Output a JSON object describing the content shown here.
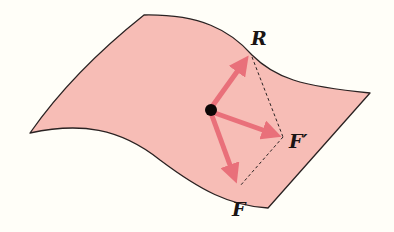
{
  "diagram": {
    "surface": {
      "fill": "#f7bdb6",
      "stroke": "#2a2222"
    },
    "particle": {
      "color": "#0c0606"
    },
    "vectors": [
      {
        "id": "R",
        "label": "R",
        "color": "#e9707a"
      },
      {
        "id": "F_prime",
        "label": "F′",
        "color": "#e9707a"
      },
      {
        "id": "F",
        "label": "F",
        "color": "#e9707a"
      }
    ],
    "construction_lines": {
      "style": "dashed",
      "color": "#2a2222",
      "connects": [
        "R",
        "F′",
        "F"
      ]
    }
  }
}
